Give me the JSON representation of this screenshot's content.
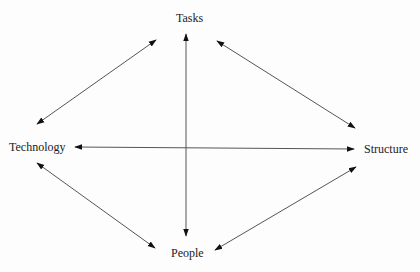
{
  "diagram": {
    "nodes": [
      {
        "id": "tasks",
        "label": "Tasks"
      },
      {
        "id": "technology",
        "label": "Technology"
      },
      {
        "id": "structure",
        "label": "Structure"
      },
      {
        "id": "people",
        "label": "People"
      }
    ],
    "edges": [
      {
        "from": "tasks",
        "to": "technology",
        "direction": "both"
      },
      {
        "from": "tasks",
        "to": "structure",
        "direction": "both"
      },
      {
        "from": "tasks",
        "to": "people",
        "direction": "both"
      },
      {
        "from": "technology",
        "to": "structure",
        "direction": "both"
      },
      {
        "from": "technology",
        "to": "people",
        "direction": "both"
      },
      {
        "from": "people",
        "to": "structure",
        "direction": "both"
      }
    ],
    "colors": {
      "line": "#555555",
      "arrowhead": "#111111",
      "text": "#222222",
      "background": "#fdfdfd"
    }
  }
}
